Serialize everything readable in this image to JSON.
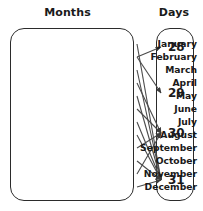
{
  "headings": {
    "left": "Months",
    "right": "Days"
  },
  "colors": {
    "stroke": "#4a4a4a",
    "outline": "#2b2b2b",
    "text": "#1a1a1a",
    "background": "#ffffff"
  },
  "months": [
    {
      "label": "January",
      "y": 44,
      "days": 31
    },
    {
      "label": "February",
      "y": 57,
      "days": 28
    },
    {
      "label": "March",
      "y": 70,
      "days": 31
    },
    {
      "label": "April",
      "y": 83,
      "days": 30
    },
    {
      "label": "May",
      "y": 96,
      "days": 31
    },
    {
      "label": "June",
      "y": 109,
      "days": 30
    },
    {
      "label": "July",
      "y": 122,
      "days": 31
    },
    {
      "label": "August",
      "y": 135,
      "days": 31
    },
    {
      "label": "September",
      "y": 148,
      "days": 30
    },
    {
      "label": "October",
      "y": 161,
      "days": 31
    },
    {
      "label": "November",
      "y": 174,
      "days": 30
    },
    {
      "label": "December",
      "y": 187,
      "days": 31
    }
  ],
  "days": [
    {
      "label": "28",
      "y": 47
    },
    {
      "label": "29",
      "y": 93
    },
    {
      "label": "30",
      "y": 133
    },
    {
      "label": "31",
      "y": 180
    }
  ],
  "edges": [
    {
      "from": "January",
      "to": "31"
    },
    {
      "from": "February",
      "to": "28"
    },
    {
      "from": "February",
      "to": "29"
    },
    {
      "from": "March",
      "to": "31"
    },
    {
      "from": "April",
      "to": "30"
    },
    {
      "from": "May",
      "to": "31"
    },
    {
      "from": "June",
      "to": "30"
    },
    {
      "from": "July",
      "to": "31"
    },
    {
      "from": "August",
      "to": "31"
    },
    {
      "from": "September",
      "to": "30"
    },
    {
      "from": "October",
      "to": "31"
    },
    {
      "from": "November",
      "to": "30"
    },
    {
      "from": "December",
      "to": "31"
    }
  ],
  "geometry": {
    "source_x": 137,
    "target_x": 161
  }
}
